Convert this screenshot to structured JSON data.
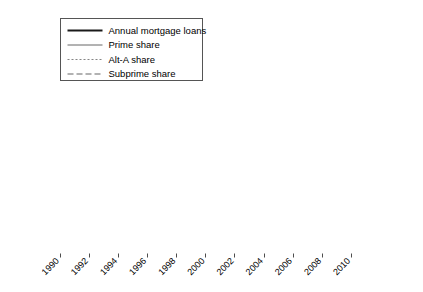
{
  "chart_data": {
    "type": "line",
    "title": "",
    "xlabel": "",
    "ylabel": "Billion $",
    "ylabel_right": "%",
    "xlim": [
      1990,
      2011
    ],
    "ylim": [
      0,
      4000
    ],
    "ylim_right": [
      0,
      100
    ],
    "grid": true,
    "legend_position": "top-left",
    "x_ticks": [
      1990,
      1992,
      1994,
      1996,
      1998,
      2000,
      2002,
      2004,
      2006,
      2008,
      2010
    ],
    "x_tick_labels": [
      "1990",
      "1992",
      "1994",
      "1996",
      "1998",
      "2000",
      "2002",
      "2004",
      "2006",
      "2008",
      "2010"
    ],
    "y_ticks_left": [
      0,
      800,
      1600,
      2400,
      3200,
      4000
    ],
    "y_tick_labels_left": [
      "0",
      "800",
      "1600",
      "2400",
      "3200",
      "4000"
    ],
    "y_ticks_right": [
      0,
      20,
      40,
      60,
      80,
      100
    ],
    "y_tick_labels_right": [
      "0",
      "20",
      "40",
      "60",
      "80",
      "100"
    ],
    "x": [
      1990,
      1991,
      1992,
      1993,
      1994,
      1995,
      1996,
      1997,
      1998,
      1999,
      2000,
      2001,
      2002,
      2003,
      2004,
      2005,
      2006,
      2007,
      2008,
      2009,
      2010,
      2011
    ],
    "series": [
      {
        "name": "Annual mortgage loans",
        "axis": "left",
        "style": "solid-thick",
        "color": "#1a1a1a",
        "values": [
          460,
          560,
          790,
          1020,
          860,
          640,
          780,
          840,
          1460,
          1290,
          1050,
          2030,
          2880,
          3950,
          2950,
          3140,
          3000,
          2350,
          1520,
          1940,
          1730,
          1390
        ]
      },
      {
        "name": "Prime share",
        "axis": "right",
        "style": "solid-thin",
        "color": "#555555",
        "values": [
          68,
          64,
          66,
          69,
          63,
          60,
          61,
          58,
          59,
          59,
          58,
          65,
          65,
          67,
          45,
          39,
          36,
          52,
          81,
          90,
          90,
          88
        ]
      },
      {
        "name": "Alt-A share",
        "axis": "right",
        "style": "dotted",
        "color": "#777777",
        "values": [
          0.5,
          0.5,
          0.6,
          0.6,
          1.0,
          1.5,
          2.0,
          2.0,
          1.5,
          2.0,
          1.3,
          1.3,
          1.4,
          2.5,
          8.0,
          11.0,
          12.0,
          6.0,
          1.0,
          0.2,
          0.2,
          0.2
        ]
      },
      {
        "name": "Subprime share",
        "axis": "right",
        "style": "dashed",
        "color": "#666666",
        "values": [
          7.2,
          7.6,
          7.8,
          7.0,
          8.5,
          8.3,
          8.4,
          9.0,
          8.8,
          9.2,
          9.2,
          6.8,
          6.4,
          6.8,
          15.5,
          19.5,
          20.0,
          9.0,
          1.0,
          0.2,
          0.2,
          0.2
        ]
      }
    ],
    "legend": [
      {
        "label": "Annual mortgage loans",
        "style": "solid-thick",
        "color": "#1a1a1a"
      },
      {
        "label": "Prime share",
        "style": "solid-thin",
        "color": "#555555"
      },
      {
        "label": "Alt-A share",
        "style": "dotted",
        "color": "#777777"
      },
      {
        "label": "Subprime share",
        "style": "dashed",
        "color": "#666666"
      }
    ],
    "colors": {
      "background": "#ffffff",
      "axis": "#4d4d4d",
      "grid": "#dcdcdc",
      "text": "#000000"
    }
  }
}
